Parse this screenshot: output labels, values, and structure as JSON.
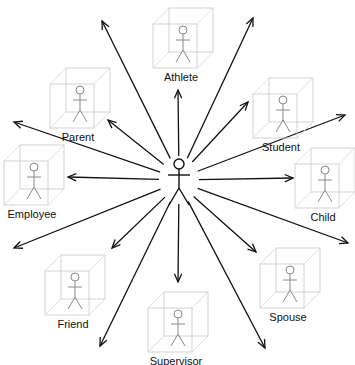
{
  "diagram": {
    "type": "radial-relationship-diagram",
    "center": {
      "role": "person"
    },
    "colors": {
      "arrow": "#111111",
      "cube": "#c8c8c8",
      "stick_figure": "#8a8a8a",
      "background": "#ffffff"
    },
    "nodes": [
      {
        "id": "athlete",
        "label": "Athlete",
        "x": 153,
        "y": 8
      },
      {
        "id": "parent",
        "label": "Parent",
        "x": 50,
        "y": 68
      },
      {
        "id": "student",
        "label": "Student",
        "x": 253,
        "y": 78
      },
      {
        "id": "employee",
        "label": "Employee",
        "x": 4,
        "y": 145
      },
      {
        "id": "child",
        "label": "Child",
        "x": 295,
        "y": 148
      },
      {
        "id": "friend",
        "label": "Friend",
        "x": 45,
        "y": 255
      },
      {
        "id": "spouse",
        "label": "Spouse",
        "x": 260,
        "y": 248
      },
      {
        "id": "supervisor",
        "label": "Supervisor",
        "x": 148,
        "y": 292
      }
    ],
    "arrows": [
      {
        "to": [
          102,
          21
        ]
      },
      {
        "to": [
          178,
          90
        ]
      },
      {
        "to": [
          253,
          18
        ]
      },
      {
        "to": [
          14,
          122
        ]
      },
      {
        "to": [
          108,
          120
        ]
      },
      {
        "to": [
          248,
          102
        ]
      },
      {
        "to": [
          345,
          115
        ]
      },
      {
        "to": [
          68,
          177
        ]
      },
      {
        "to": [
          293,
          178
        ]
      },
      {
        "to": [
          14,
          248
        ]
      },
      {
        "to": [
          348,
          243
        ]
      },
      {
        "to": [
          112,
          248
        ]
      },
      {
        "to": [
          256,
          252
        ]
      },
      {
        "to": [
          178,
          282
        ]
      },
      {
        "to": [
          100,
          346
        ]
      },
      {
        "to": [
          265,
          348
        ]
      }
    ]
  }
}
